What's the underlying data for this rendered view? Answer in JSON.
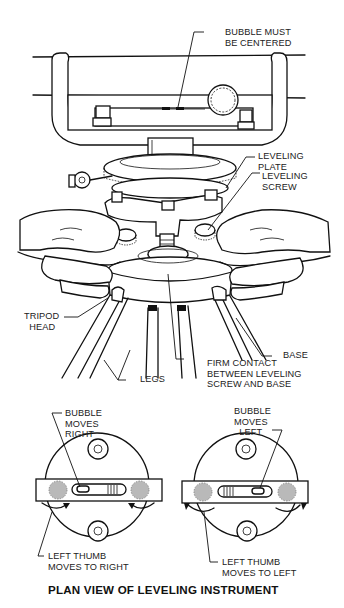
{
  "figure": {
    "title": "PLAN VIEW OF LEVELING INSTRUMENT",
    "top_view_labels": {
      "bubble_centered": "BUBBLE MUST\nBE CENTERED",
      "leveling_plate": "LEVELING\nPLATE",
      "leveling_screw": "LEVELING\nSCREW",
      "tripod_head": "TRIPOD\n  HEAD",
      "base": "BASE",
      "legs": "LEGS",
      "firm_contact": "FIRM CONTACT\nBETWEEN LEVELING\nSCREW AND BASE"
    },
    "plan_left": {
      "bubble_label": "BUBBLE\nMOVES\nRIGHT",
      "thumb_label": "LEFT THUMB\nMOVES TO RIGHT"
    },
    "plan_right": {
      "bubble_label": "BUBBLE\nMOVES\n  LEFT",
      "thumb_label": "LEFT THUMB\nMOVES TO LEFT"
    }
  }
}
